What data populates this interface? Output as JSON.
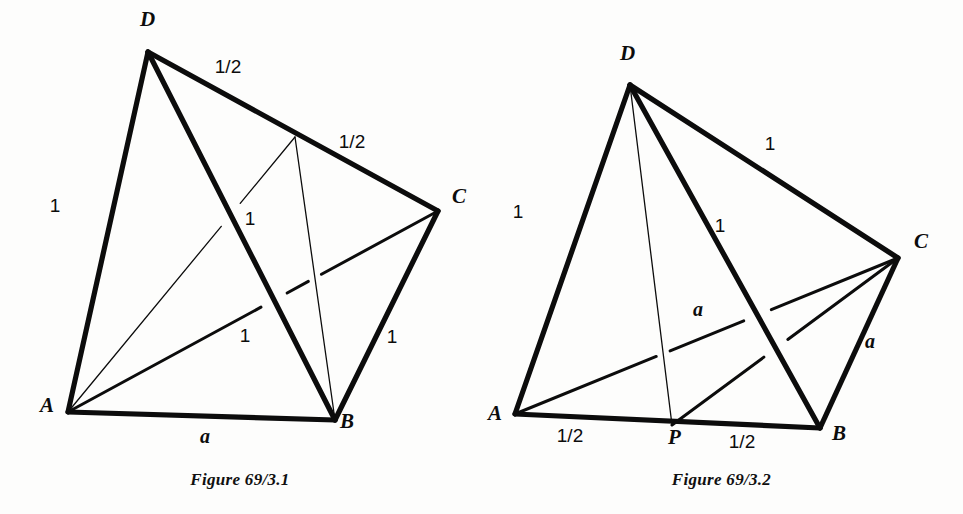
{
  "document": {
    "kind": "geometry-figure-pair",
    "background_color": "#fdfdfc",
    "ink_color": "#0c0c0c"
  },
  "figures": [
    {
      "id": "figure-left",
      "caption": "Figure 69/3.1",
      "description": "Tetrahedron ABCD with midpoint M of edge DC joined to A and to B",
      "vertices": [
        {
          "name": "A",
          "label": "A",
          "x": 68,
          "y": 412,
          "label_x": 40,
          "label_y": 412
        },
        {
          "name": "B",
          "label": "B",
          "x": 335,
          "y": 420,
          "label_x": 340,
          "label_y": 428
        },
        {
          "name": "C",
          "label": "C",
          "x": 438,
          "y": 211,
          "label_x": 452,
          "label_y": 203
        },
        {
          "name": "D",
          "label": "D",
          "x": 148,
          "y": 52,
          "label_x": 140,
          "label_y": 26
        },
        {
          "name": "M",
          "label": "",
          "x": 295,
          "y": 137,
          "label_x": 0,
          "label_y": 0
        }
      ],
      "edges": [
        {
          "name": "edge-AD",
          "from": "A",
          "to": "D",
          "weight": "thick"
        },
        {
          "name": "edge-DC",
          "from": "D",
          "to": "C",
          "weight": "thick"
        },
        {
          "name": "edge-CB",
          "from": "C",
          "to": "B",
          "weight": "thick"
        },
        {
          "name": "edge-AB",
          "from": "A",
          "to": "B",
          "weight": "thick"
        },
        {
          "name": "edge-DB",
          "from": "D",
          "to": "B",
          "weight": "thick"
        },
        {
          "name": "edge-AC",
          "from": "A",
          "to": "C",
          "weight": "medium"
        },
        {
          "name": "edge-AM",
          "from": "A",
          "to": "M",
          "weight": "thin"
        },
        {
          "name": "edge-MB",
          "from": "M",
          "to": "B",
          "weight": "thin"
        }
      ],
      "measures": [
        {
          "name": "measure-AD",
          "text": "1",
          "x": 55,
          "y": 212,
          "style": "plain"
        },
        {
          "name": "measure-DM",
          "text": "1/2",
          "x": 228,
          "y": 73,
          "style": "plain"
        },
        {
          "name": "measure-MC",
          "text": "1/2",
          "x": 352,
          "y": 148,
          "style": "plain"
        },
        {
          "name": "measure-CB",
          "text": "1",
          "x": 392,
          "y": 343,
          "style": "plain"
        },
        {
          "name": "measure-AM",
          "text": "1",
          "x": 250,
          "y": 225,
          "style": "plain"
        },
        {
          "name": "measure-AC",
          "text": "1",
          "x": 245,
          "y": 342,
          "style": "plain"
        },
        {
          "name": "measure-AB",
          "text": "a",
          "x": 205,
          "y": 443,
          "style": "italic"
        }
      ]
    },
    {
      "id": "figure-right",
      "caption": "Figure 69/3.2",
      "description": "Tetrahedron ABCD with P the midpoint of AB, joined to D and to C; AC and BC both equal a",
      "vertices": [
        {
          "name": "A",
          "label": "A",
          "x": 35,
          "y": 414,
          "label_x": 8,
          "label_y": 420
        },
        {
          "name": "P",
          "label": "P",
          "x": 192,
          "y": 425,
          "label_x": 188,
          "label_y": 444
        },
        {
          "name": "B",
          "label": "B",
          "x": 340,
          "y": 428,
          "label_x": 352,
          "label_y": 440
        },
        {
          "name": "C",
          "label": "C",
          "x": 418,
          "y": 258,
          "label_x": 434,
          "label_y": 248
        },
        {
          "name": "D",
          "label": "D",
          "x": 150,
          "y": 85,
          "label_x": 140,
          "label_y": 60
        }
      ],
      "edges": [
        {
          "name": "edge-AD",
          "from": "A",
          "to": "D",
          "weight": "thick"
        },
        {
          "name": "edge-DC",
          "from": "D",
          "to": "C",
          "weight": "thick"
        },
        {
          "name": "edge-CB",
          "from": "C",
          "to": "B",
          "weight": "thick"
        },
        {
          "name": "edge-AB",
          "from": "A",
          "to": "B",
          "weight": "thick"
        },
        {
          "name": "edge-DB",
          "from": "D",
          "to": "B",
          "weight": "thick"
        },
        {
          "name": "edge-AC",
          "from": "A",
          "to": "C",
          "weight": "medium"
        },
        {
          "name": "edge-PC",
          "from": "P",
          "to": "C",
          "weight": "medium"
        },
        {
          "name": "edge-DP",
          "from": "D",
          "to": "P",
          "weight": "thin"
        }
      ],
      "measures": [
        {
          "name": "measure-AD",
          "text": "1",
          "x": 38,
          "y": 218,
          "style": "plain"
        },
        {
          "name": "measure-DC",
          "text": "1",
          "x": 290,
          "y": 150,
          "style": "plain"
        },
        {
          "name": "measure-DB",
          "text": "1",
          "x": 240,
          "y": 232,
          "style": "plain"
        },
        {
          "name": "measure-CB",
          "text": "a",
          "x": 390,
          "y": 348,
          "style": "italic"
        },
        {
          "name": "measure-AC",
          "text": "a",
          "x": 218,
          "y": 316,
          "style": "italic"
        },
        {
          "name": "measure-AP",
          "text": "1/2",
          "x": 90,
          "y": 442,
          "style": "plain"
        },
        {
          "name": "measure-PB",
          "text": "1/2",
          "x": 262,
          "y": 448,
          "style": "plain"
        }
      ]
    }
  ]
}
